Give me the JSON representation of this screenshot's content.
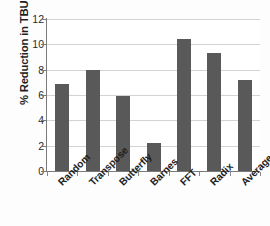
{
  "chart_data": {
    "type": "bar",
    "title": "",
    "subtitle": "",
    "xlabel": "",
    "ylabel": "% Reduction in TBUF Overflow",
    "categories": [
      "Random",
      "Transpose",
      "Butterfly",
      "Barnes",
      "FFT",
      "Radix",
      "Average"
    ],
    "values": [
      6.85,
      7.95,
      5.9,
      2.2,
      10.4,
      9.3,
      7.15
    ],
    "ylim": [
      0,
      12
    ],
    "ytick_labels": [
      "0",
      "2",
      "4",
      "6",
      "8",
      "10",
      "12"
    ],
    "ytick_values": [
      0,
      2,
      4,
      6,
      8,
      10,
      12
    ],
    "grid": "horizontal",
    "legend": "none",
    "bar_color": "#595959",
    "gridline_color": "#d3d3d3",
    "axis_color": "#7a7a7a",
    "background": "#ffffff",
    "annotations": []
  }
}
